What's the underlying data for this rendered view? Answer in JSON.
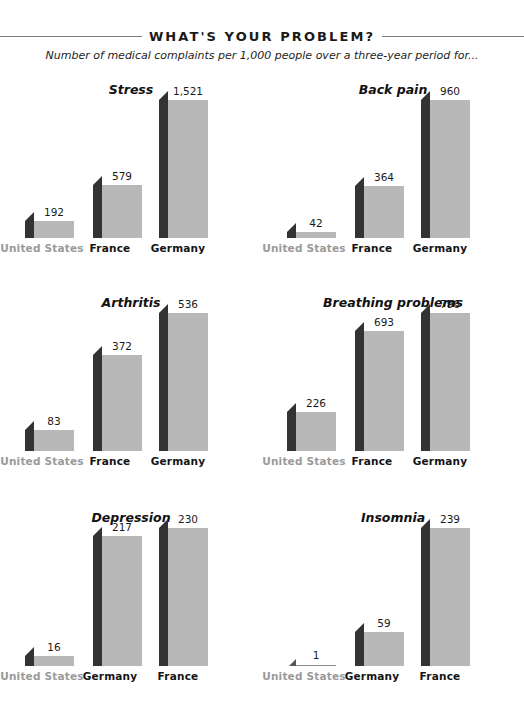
{
  "header": {
    "title": "WHAT'S YOUR PROBLEM?",
    "subtitle": "Number of medical complaints per 1,000 people over a three-year period for..."
  },
  "style": {
    "bar_front_color": "#b8b8b8",
    "bar_side_color": "#333333",
    "muted_label_color": "#9a9a9a",
    "label_color": "#141414",
    "rule_color": "#7d7d7d",
    "background": "#ffffff"
  },
  "chart_data": [
    {
      "type": "bar",
      "title": "Stress",
      "categories": [
        "United States",
        "France",
        "Germany"
      ],
      "values": [
        192,
        579,
        1521
      ],
      "value_labels": [
        "192",
        "579",
        "1,521"
      ],
      "muted_categories": [
        "United States"
      ],
      "xlabel": "",
      "ylabel": "",
      "ylim": [
        0,
        1521
      ],
      "grid": false,
      "legend": "none"
    },
    {
      "type": "bar",
      "title": "Back pain",
      "categories": [
        "United States",
        "France",
        "Germany"
      ],
      "values": [
        42,
        364,
        960
      ],
      "value_labels": [
        "42",
        "364",
        "960"
      ],
      "muted_categories": [
        "United States"
      ],
      "xlabel": "",
      "ylabel": "",
      "ylim": [
        0,
        960
      ],
      "grid": false,
      "legend": "none"
    },
    {
      "type": "bar",
      "title": "Arthritis",
      "categories": [
        "United States",
        "France",
        "Germany"
      ],
      "values": [
        83,
        372,
        536
      ],
      "value_labels": [
        "83",
        "372",
        "536"
      ],
      "muted_categories": [
        "United States"
      ],
      "xlabel": "",
      "ylabel": "",
      "ylim": [
        0,
        536
      ],
      "grid": false,
      "legend": "none"
    },
    {
      "type": "bar",
      "title": "Breathing problems",
      "categories": [
        "United States",
        "France",
        "Germany"
      ],
      "values": [
        226,
        693,
        796
      ],
      "value_labels": [
        "226",
        "693",
        "796"
      ],
      "muted_categories": [
        "United States"
      ],
      "xlabel": "",
      "ylabel": "",
      "ylim": [
        0,
        796
      ],
      "grid": false,
      "legend": "none"
    },
    {
      "type": "bar",
      "title": "Depression",
      "categories": [
        "United States",
        "Germany",
        "France"
      ],
      "values": [
        16,
        217,
        230
      ],
      "value_labels": [
        "16",
        "217",
        "230"
      ],
      "muted_categories": [
        "United States"
      ],
      "xlabel": "",
      "ylabel": "",
      "ylim": [
        0,
        230
      ],
      "grid": false,
      "legend": "none"
    },
    {
      "type": "bar",
      "title": "Insomnia",
      "categories": [
        "United States",
        "Germany",
        "France"
      ],
      "values": [
        1,
        59,
        239
      ],
      "value_labels": [
        "1",
        "59",
        "239"
      ],
      "muted_categories": [
        "United States"
      ],
      "xlabel": "",
      "ylabel": "",
      "ylim": [
        0,
        239
      ],
      "grid": false,
      "legend": "none"
    }
  ]
}
